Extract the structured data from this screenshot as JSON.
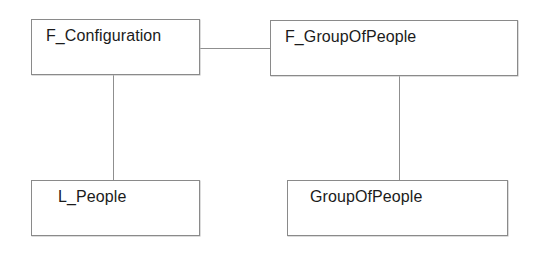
{
  "diagram": {
    "type": "uml-class-diagram",
    "background_color": "#ffffff",
    "border_color": "#8a8a8a",
    "line_color": "#8f8f8f",
    "text_color": "#1b1b1b",
    "nodes": [
      {
        "id": "f_configuration",
        "label": "F_Configuration"
      },
      {
        "id": "f_groupofpeople",
        "label": "F_GroupOfPeople"
      },
      {
        "id": "l_people",
        "label": "L_People"
      },
      {
        "id": "groupofpeople",
        "label": "GroupOfPeople"
      }
    ],
    "edges": [
      {
        "id": "config-group",
        "from": "f_configuration",
        "to": "f_groupofpeople",
        "orientation": "horizontal"
      },
      {
        "id": "config-people",
        "from": "f_configuration",
        "to": "l_people",
        "orientation": "vertical"
      },
      {
        "id": "group-group",
        "from": "f_groupofpeople",
        "to": "groupofpeople",
        "orientation": "vertical"
      }
    ]
  }
}
